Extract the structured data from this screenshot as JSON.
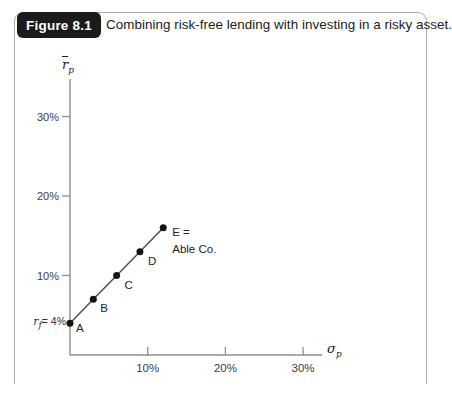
{
  "figure": {
    "label": "Figure 8.1",
    "caption": "Combining risk-free lending with investing in a risky asset."
  },
  "colors": {
    "figure_badge_bg": "#1b1b1b",
    "figure_badge_text": "#ffffff",
    "frame_border": "#a9a9a9",
    "axis": "#8e8e8e",
    "line": "#4f4f4f",
    "point": "#141414",
    "tick_text": "#3c3c3c",
    "point_label_text": "#222222"
  },
  "chart_data": {
    "type": "scatter",
    "title": "",
    "xlabel": "σp",
    "ylabel": "r̄p",
    "xlabel_parts": {
      "base": "σ",
      "sub": "p"
    },
    "ylabel_parts": {
      "base": "r",
      "sub": "p",
      "overline": true
    },
    "xlim": [
      0,
      32.4
    ],
    "ylim": [
      0,
      34.7
    ],
    "grid": false,
    "legend": false,
    "x_ticks": [
      {
        "value": 10,
        "label": "10%"
      },
      {
        "value": 20,
        "label": "20%"
      },
      {
        "value": 30,
        "label": "30%"
      }
    ],
    "y_ticks": [
      {
        "value": 10,
        "label": "10%"
      },
      {
        "value": 20,
        "label": "20%"
      },
      {
        "value": 30,
        "label": "30%"
      }
    ],
    "risk_free_rate_label": {
      "base": "r",
      "sub": "f",
      "rest": "= 4%"
    },
    "points": [
      {
        "label": "A",
        "x": 0,
        "y": 4
      },
      {
        "label": "B",
        "x": 3,
        "y": 7
      },
      {
        "label": "C",
        "x": 6,
        "y": 10
      },
      {
        "label": "D",
        "x": 9,
        "y": 13
      },
      {
        "label": "E",
        "x": 12,
        "y": 16,
        "annotation": [
          "E =",
          "Able Co."
        ]
      }
    ],
    "line_through_points": true
  }
}
